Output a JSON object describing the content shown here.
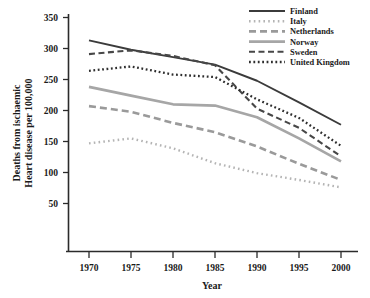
{
  "chart_data": {
    "type": "line",
    "title": "",
    "xlabel": "Year",
    "ylabel": "Deaths from ischaemic Heart disease per 100,000",
    "ylabel_line1": "Deaths from ischaemic",
    "ylabel_line2": "Heart disease per 100,000",
    "x": [
      1970,
      1975,
      1980,
      1985,
      1990,
      1995,
      2000
    ],
    "xticklabels": [
      "1970",
      "1975",
      "1980",
      "1985",
      "1990",
      "1995",
      "2000"
    ],
    "yticks": [
      50,
      100,
      150,
      200,
      250,
      300,
      350
    ],
    "yticklabels": [
      "50",
      "100",
      "150",
      "200",
      "250",
      "300",
      "350"
    ],
    "xlim": [
      1968,
      2002
    ],
    "ylim": [
      30,
      365
    ],
    "grid": false,
    "legend_position": "top-right",
    "series": [
      {
        "name": "Finland",
        "color": "#3b3b3b",
        "linestyle": "solid",
        "dasharray": "",
        "width": 1.9,
        "values": [
          313,
          298,
          286,
          274,
          248,
          213,
          177
        ]
      },
      {
        "name": "Italy",
        "color": "#b4b4b4",
        "linestyle": "dotted",
        "dasharray": "1.6 3.2",
        "width": 2.4,
        "values": [
          147,
          155,
          139,
          115,
          99,
          88,
          76
        ]
      },
      {
        "name": "Netherlands",
        "color": "#9a9a9a",
        "linestyle": "dashed",
        "dasharray": "7 4",
        "width": 2.6,
        "values": [
          207,
          198,
          180,
          165,
          142,
          114,
          88
        ]
      },
      {
        "name": "Norway",
        "color": "#a6a6a6",
        "linestyle": "solid",
        "dasharray": "",
        "width": 2.7,
        "values": [
          238,
          224,
          210,
          208,
          189,
          155,
          118
        ]
      },
      {
        "name": "Sweden",
        "color": "#474747",
        "linestyle": "dashed",
        "dasharray": "6 3.5",
        "width": 2.1,
        "values": [
          291,
          297,
          288,
          273,
          203,
          172,
          126
        ]
      },
      {
        "name": "United Kingdom",
        "color": "#2e2e2e",
        "linestyle": "dotted",
        "dasharray": "1.8 2.6",
        "width": 2.3,
        "values": [
          264,
          271,
          258,
          254,
          218,
          188,
          143
        ]
      }
    ]
  },
  "axes": {
    "x_tick_count": 7,
    "y_tick_count": 7
  }
}
